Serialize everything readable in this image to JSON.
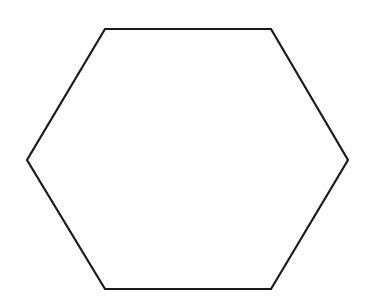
{
  "canvas": {
    "width": 374,
    "height": 298,
    "background_color": "#ffffff",
    "name": "white-drawing-canvas"
  },
  "figure": {
    "kind": "geometric-shape",
    "shape_name": "hexagon",
    "orientation": "flat-top",
    "sides": 6,
    "fill": "none",
    "fill_color": "#ffffff",
    "stroke_color": "#1a1a1a",
    "stroke_width": 2.2,
    "stroke_linejoin": "miter",
    "label": "",
    "vertices": [
      {
        "name": "top-left",
        "x": 105,
        "y": 29
      },
      {
        "name": "top-right",
        "x": 271,
        "y": 29
      },
      {
        "name": "right",
        "x": 348,
        "y": 160
      },
      {
        "name": "bottom-right",
        "x": 271,
        "y": 289
      },
      {
        "name": "bottom-left",
        "x": 105,
        "y": 289
      },
      {
        "name": "left",
        "x": 27,
        "y": 160
      }
    ],
    "points_attr": "105,29 271,29 348,160 271,289 105,289 27,160",
    "bounding_box": {
      "x": 27,
      "y": 29,
      "width": 321,
      "height": 260
    },
    "center": {
      "x": 187.5,
      "y": 159
    }
  }
}
